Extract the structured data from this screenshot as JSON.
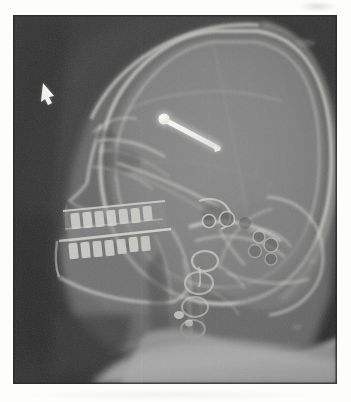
{
  "page": {
    "kind": "medical-radiograph",
    "modality": "X-ray",
    "view": "lateral skull (cephalometric / lateral cephalogram)",
    "background_color": "#fdfdfc",
    "film_border_color": "#2e2e2e"
  },
  "film": {
    "x": 13,
    "y": 15,
    "width": 324,
    "height": 369,
    "base_density_color": "#3a3a3a",
    "soft_tissue_color": "#7d7d7d",
    "bone_color": "#c9c9c9",
    "metal_color": "#f6f6f2"
  },
  "annotations": {
    "arrow_marker": {
      "name": "arrow-marker",
      "label": "",
      "x": 46,
      "y": 89,
      "color": "#f2f2ee",
      "points_to": "frontal soft tissue / forehead"
    },
    "metal_implant": {
      "name": "metallic-pin",
      "label": "",
      "start_x": 164,
      "start_y": 118,
      "end_x": 216,
      "end_y": 147,
      "head_radius": 5.5,
      "shaft_width": 4.5,
      "color": "#f6f6f2",
      "description": "radiopaque pin/screw projected over the anterior cranial fossa"
    }
  },
  "anatomy": [
    {
      "name": "cranial-vault",
      "label": "Cranial vault (calvarium)"
    },
    {
      "name": "frontal-bone",
      "label": "Frontal bone"
    },
    {
      "name": "parietal-bone",
      "label": "Parietal bone"
    },
    {
      "name": "occipital-bone",
      "label": "Occipital bone"
    },
    {
      "name": "scalp-soft-tissue",
      "label": "Scalp soft-tissue outline"
    },
    {
      "name": "orbit",
      "label": "Orbital rim"
    },
    {
      "name": "nasal-bone",
      "label": "Nasal bone / nasion"
    },
    {
      "name": "maxilla",
      "label": "Maxilla with dentition"
    },
    {
      "name": "mandible",
      "label": "Mandible with dentition"
    },
    {
      "name": "sella-turcica",
      "label": "Sella turcica"
    },
    {
      "name": "petrous-temporal",
      "label": "Petrous temporal bone"
    },
    {
      "name": "mastoid-air-cells",
      "label": "Mastoid air cells"
    },
    {
      "name": "cervical-spine",
      "label": "Cervical vertebrae C1–C4"
    },
    {
      "name": "neck-soft-tissue",
      "label": "Neck / shoulder soft tissue"
    },
    {
      "name": "hard-palate",
      "label": "Hard palate"
    },
    {
      "name": "ramus-mandible",
      "label": "Mandibular ramus"
    }
  ]
}
